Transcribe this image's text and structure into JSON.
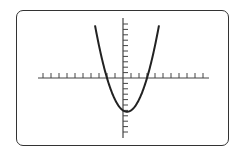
{
  "chart_data": {
    "type": "line",
    "title": "",
    "xlabel": "",
    "ylabel": "",
    "equation_inferred": "y = x^2 - x - 6",
    "series": [
      {
        "name": "parabola",
        "x": [
          -3.5,
          -3,
          -2.5,
          -2,
          -1.5,
          -1,
          -0.5,
          0,
          0.5,
          1,
          1.5,
          2,
          2.5,
          3,
          3.5,
          4.5
        ],
        "y": [
          9.75,
          6,
          2.75,
          0,
          -2.25,
          -4,
          -5.25,
          -6,
          -6.25,
          -6,
          -5.25,
          -4,
          -2.25,
          0,
          2.75,
          9.75
        ]
      }
    ],
    "roots": [
      -2,
      3
    ],
    "vertex": [
      0.5,
      -6.25
    ],
    "x_ticks": {
      "min": -10,
      "max": 10,
      "step": 1
    },
    "y_ticks": {
      "min": -10,
      "max": 10,
      "step": 1
    },
    "xlim": [
      -10.6,
      10.6
    ],
    "ylim": [
      -11,
      11
    ],
    "grid": false,
    "legend": "none"
  },
  "colors": {
    "curve": "#222222",
    "axes": "#444444",
    "frame": "#333333",
    "background": "#ffffff"
  }
}
